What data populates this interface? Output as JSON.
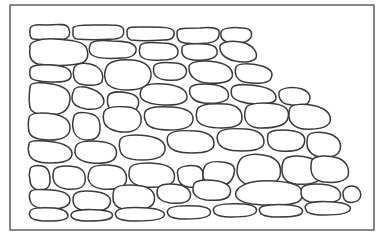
{
  "colors": {
    "background": "#ffffff",
    "frame": "#555555",
    "stone_outline": "#3a3a3a",
    "stone_fill": "#ffffff"
  },
  "frame": {
    "x": 10,
    "y": 5,
    "width": 364,
    "height": 225
  },
  "stones": [
    "M30,31 C29,25 36,24 45,25 C55,25 65,23 68,27 C71,33 70,38 64,39 C52,40 40,40 33,39 C29,38 30,34 30,31 Z",
    "M73,30 C72,25 80,25 95,25 C110,25 120,24 123,28 C125,34 123,38 115,39 C100,40 85,40 77,39 C72,38 73,34 73,30 Z",
    "M127,31 C127,26 135,27 150,27 C162,27 173,27 174,32 C175,37 172,40 164,40 C150,41 138,41 131,40 C127,39 127,35 127,31 Z",
    "M177,32 C177,28 185,28 200,28 C210,27 218,28 219,31 C220,37 217,42 208,43 C196,44 186,44 181,42 C177,40 177,36 177,32 Z",
    "M221,32 C222,28 232,27 242,28 C250,28 253,32 251,37 C249,42 240,44 232,43 C223,42 220,38 221,32 Z",
    "M30,48 C28,42 40,38 55,39 C70,40 82,41 86,47 C89,54 88,60 82,63 C70,66 50,66 38,64 C30,62 29,55 30,48 Z",
    "M90,45 C91,41 100,40 112,41 C124,41 134,42 136,48 C137,54 132,58 122,58 C108,59 96,58 92,55 C88,52 89,48 90,45 Z",
    "M140,47 C140,42 150,42 162,43 C172,43 178,46 178,52 C178,58 172,60 162,60 C150,61 142,59 140,55 C139,52 139,50 140,47 Z",
    "M182,48 C182,44 192,43 205,44 C215,45 218,48 217,54 C215,59 205,61 194,60 C184,59 181,55 182,48 Z",
    "M220,46 C222,41 234,40 245,43 C253,46 258,52 256,58 C253,62 244,63 235,61 C225,59 219,53 220,46 Z",
    "M30,70 C30,65 40,64 52,65 C64,66 70,68 71,74 C72,80 66,82 56,82 C44,82 34,81 31,78 C29,75 30,73 30,70 Z",
    "M74,68 C76,62 88,62 96,66 C102,70 104,76 102,82 C98,86 88,86 80,84 C74,82 72,75 74,68 Z",
    "M106,68 C108,61 120,59 132,60 C144,61 152,66 151,76 C150,86 142,90 128,90 C114,90 106,86 105,78 C104,74 105,71 106,68 Z",
    "M154,66 C156,62 166,62 176,63 C184,64 188,68 186,74 C184,80 176,81 166,80 C156,79 152,74 154,66 Z",
    "M189,66 C191,61 204,60 216,62 C228,64 234,70 232,77 C230,82 220,84 207,83 C195,82 188,75 189,66 Z",
    "M236,67 C238,63 250,63 262,66 C272,69 274,74 270,80 C266,84 254,84 244,82 C236,80 234,73 236,67 Z",
    "M30,87 C30,82 40,82 52,84 C64,86 70,90 70,98 C70,106 66,112 58,114 C46,116 36,115 31,110 C28,104 29,95 30,87 Z",
    "M74,90 C76,86 84,86 92,89 C100,92 104,96 104,102 C103,108 96,110 86,109 C78,108 72,104 72,98 C72,95 73,92 74,90 Z",
    "M108,96 C110,92 118,91 128,93 C138,95 140,100 138,106 C136,112 128,114 118,113 C110,112 106,106 108,96 Z",
    "M141,90 C143,85 152,83 164,84 C176,85 186,88 187,96 C188,102 180,105 168,105 C156,105 146,103 142,99 C139,96 140,93 141,90 Z",
    "M190,88 C192,84 204,83 216,85 C226,87 230,92 228,98 C226,102 216,104 204,103 C194,102 188,96 190,88 Z",
    "M232,88 C234,84 246,84 258,86 C270,88 276,92 276,98 C276,103 268,104 256,104 C244,104 234,100 232,96 C231,93 231,90 232,88 Z",
    "M279,92 C281,88 292,86 302,89 C310,92 312,98 308,103 C304,106 294,106 286,104 C280,102 278,96 279,92 Z",
    "M29,118 C29,113 40,112 54,114 C64,116 70,120 70,128 C70,136 62,140 50,140 C38,140 31,138 29,132 C28,126 28,122 29,118 Z",
    "M74,116 C76,112 84,112 92,114 C98,116 100,120 100,128 C100,136 96,140 88,140 C80,140 74,136 73,128 C72,124 73,120 74,116 Z",
    "M104,112 C106,107 116,106 128,107 C138,108 142,114 141,122 C140,128 134,132 124,132 C114,132 106,128 104,122 C103,118 103,115 104,112 Z",
    "M145,112 C147,107 158,106 172,107 C186,108 194,112 193,120 C192,127 184,130 170,130 C156,130 148,128 146,122 C144,118 144,115 145,112 Z",
    "M197,110 C199,104 212,103 226,104 C238,105 242,110 242,118 C242,125 234,128 222,128 C208,128 200,126 197,120 C196,116 196,113 197,110 Z",
    "M246,108 C248,103 262,102 276,104 C286,106 290,110 288,118 C286,126 276,128 262,128 C252,128 246,124 245,118 C244,114 245,111 246,108 Z",
    "M290,108 C292,104 304,103 316,106 C326,109 332,114 330,122 C327,128 316,130 304,129 C294,128 289,122 289,116 C289,113 289,110 290,108 Z",
    "M29,144 C29,140 40,140 54,142 C66,144 72,148 72,154 C72,160 64,163 50,163 C38,163 31,160 29,154 C28,150 28,147 29,144 Z",
    "M76,146 C78,141 90,140 104,142 C114,144 118,148 116,156 C114,162 104,164 92,163 C82,162 75,158 75,152 C75,150 75,148 76,146 Z",
    "M120,140 C122,135 134,134 148,136 C160,138 166,142 165,150 C164,157 156,160 142,160 C128,160 121,156 120,150 C119,146 119,143 120,140 Z",
    "M168,136 C170,131 182,130 196,131 C208,132 214,136 214,144 C214,150 206,153 192,153 C178,153 170,150 168,144 C167,141 167,138 168,136 Z",
    "M218,134 C220,129 232,128 246,129 C258,130 264,134 264,142 C264,148 256,151 242,151 C228,151 220,148 218,142 C217,139 217,136 218,134 Z",
    "M268,134 C270,130 282,129 294,131 C304,133 306,138 304,144 C302,150 292,152 280,151 C270,150 266,144 268,134 Z",
    "M308,136 C310,132 320,131 330,134 C338,137 342,142 340,150 C338,156 330,158 320,157 C312,156 307,150 307,144 C307,141 307,138 308,136 Z",
    "M30,170 C30,166 36,165 42,166 C48,167 50,172 50,180 C50,188 46,190 40,190 C34,190 30,186 30,180 C29,176 29,173 30,170 Z",
    "M54,170 C56,166 66,165 76,167 C84,169 86,174 85,182 C84,188 76,190 66,189 C58,188 54,184 53,178 C53,175 53,172 54,170 Z",
    "M90,170 C92,165 104,164 116,166 C124,168 128,174 126,182 C124,188 114,190 102,189 C94,188 89,184 88,178 C88,175 89,172 90,170 Z",
    "M130,168 C132,163 146,162 160,164 C172,166 176,172 174,180 C172,186 160,188 146,187 C136,186 130,182 129,176 C129,173 129,170 130,168 Z",
    "M178,170 C180,166 190,165 196,166 C202,167 204,172 203,180 C202,186 196,188 188,187 C182,186 178,182 178,176 C177,173 177,172 178,170 Z",
    "M204,168 C206,162 214,161 222,162 C232,163 236,166 234,174 C232,182 226,186 218,186 C210,186 204,182 203,176 C203,173 203,170 204,168 Z",
    "M240,160 C244,154 256,153 268,156 C278,159 282,166 280,176 C277,184 266,187 254,186 C244,185 238,180 237,172 C237,167 238,163 240,160 Z",
    "M284,160 C288,155 300,155 310,158 C320,161 324,168 322,176 C319,183 308,185 296,184 C287,183 282,178 282,170 C282,166 282,163 284,160 Z",
    "M312,160 C316,155 328,155 338,158 C346,161 350,168 348,176 C345,182 334,183 324,182 C316,181 311,176 311,168 C311,164 311,162 312,160 Z",
    "M30,193 C30,189 40,189 52,190 C64,191 70,194 70,200 C70,206 62,209 50,209 C38,209 31,206 30,200 C29,197 29,195 30,193 Z",
    "M74,195 C76,191 86,190 98,192 C108,194 112,198 110,204 C108,210 98,212 86,211 C78,210 73,206 73,200 C73,198 73,196 74,195 Z",
    "M114,190 C116,185 128,184 142,186 C152,188 156,194 154,202 C152,208 142,211 128,210 C118,209 113,205 113,198 C113,195 113,192 114,190 Z",
    "M158,188 C160,184 170,183 180,185 C188,187 192,192 190,198 C188,203 180,204 170,203 C162,202 157,198 157,193 C157,191 157,189 158,188 Z",
    "M194,184 C196,180 206,179 218,181 C228,183 232,188 230,194 C228,200 218,201 206,200 C198,199 193,195 193,190 C193,188 193,186 194,184 Z",
    "M236,192 C238,186 248,182 260,181 C274,180 290,182 298,186 C304,190 304,198 298,202 C288,206 268,206 252,204 C240,202 234,198 236,192 Z",
    "M302,188 C304,184 316,183 328,185 C338,187 342,192 340,198 C338,202 328,204 316,203 C306,202 301,198 301,193 C301,191 301,189 302,188 Z",
    "M344,190 C346,186 352,185 356,187 C360,189 362,194 360,198 C358,202 352,203 348,202 C344,201 343,197 343,193 C343,192 343,191 344,190 Z",
    "M30,212 C30,208 40,207 54,208 C64,209 68,212 68,216 C68,220 60,221 48,221 C38,221 31,219 30,216 C29,214 29,213 30,212 Z",
    "M72,213 C74,210 86,209 100,210 C110,211 114,213 112,217 C110,220 100,221 88,221 C78,221 72,219 71,216 C71,215 71,214 72,213 Z",
    "M116,212 C118,208 132,207 148,208 C160,209 166,212 164,216 C162,220 150,221 136,221 C124,221 117,219 116,216 C115,214 115,213 116,212 Z",
    "M168,210 C170,206 184,205 198,206 C208,207 212,210 210,214 C208,218 198,219 186,219 C176,219 169,217 168,214 C167,212 167,211 168,210 Z",
    "M214,208 C216,204 230,203 244,204 C254,205 258,208 256,212 C254,216 244,217 232,217 C222,217 215,215 214,212 C213,210 213,209 214,208 Z",
    "M260,208 C262,205 276,204 290,205 C300,206 304,209 302,213 C300,216 290,217 278,217 C268,217 261,215 260,212 C259,210 259,209 260,208 Z",
    "M306,205 C308,202 320,201 334,202 C346,203 352,206 350,210 C348,214 336,215 324,215 C314,215 307,213 306,210 C305,208 305,206 306,205 Z"
  ]
}
